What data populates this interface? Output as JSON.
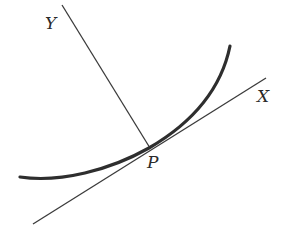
{
  "diagram": {
    "labels": {
      "y_axis": "Y",
      "x_axis": "X",
      "point": "P"
    },
    "colors": {
      "background": "#ffffff",
      "lines": "#3a3a3a",
      "curve": "#2e2e2e",
      "text": "#2a2a2a"
    },
    "elements": [
      {
        "type": "line",
        "name": "normal-line-Y",
        "from": [
          62,
          5
        ],
        "to": [
          150,
          148
        ]
      },
      {
        "type": "line",
        "name": "tangent-line-X",
        "from": [
          33,
          224
        ],
        "to": [
          266,
          78
        ]
      },
      {
        "type": "curve",
        "name": "curve",
        "from": [
          20,
          177
        ],
        "through": [
          149,
          148
        ],
        "to": [
          230,
          46
        ]
      }
    ]
  }
}
